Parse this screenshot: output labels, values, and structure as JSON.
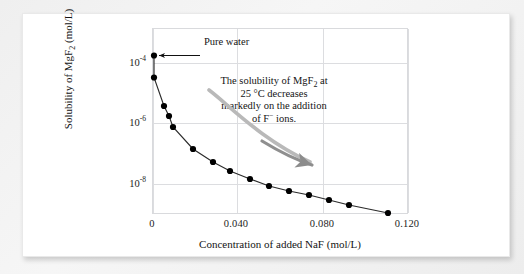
{
  "figure": {
    "background_color": "#ffffff",
    "page_background": "#f1f1f1"
  },
  "axes": {
    "x": {
      "label": "Concentration of added NaF (mol/L)",
      "ticks": [
        "0",
        "0.040",
        "0.080",
        "0.120"
      ],
      "tick_values": [
        0,
        0.04,
        0.08,
        0.12
      ],
      "range": [
        0,
        0.13
      ]
    },
    "y": {
      "label_prefix": "Solubility of MgF",
      "label_sub": "2",
      "label_suffix": " (mol/L)",
      "label": "Solubility of MgF2 (mol/L)",
      "ticks": [
        "10",
        "10",
        "10"
      ],
      "tick_exponents": [
        "-4",
        "-6",
        "-8"
      ],
      "tick_values": [
        0.0001,
        1e-06,
        1e-08
      ],
      "scale": "log",
      "range": [
        3.2e-09,
        0.00032
      ]
    }
  },
  "annotations": {
    "pure_water": {
      "text": "Pure water",
      "arrow": "left-arrow-to-first-point"
    },
    "trend_note": {
      "line1_a": "The solubility of MgF",
      "line1_sub": "2",
      "line1_b": " at",
      "line2": "25 °C decreases",
      "line3": "markedly on  the addition",
      "line4_a": "of F",
      "line4_sup": "−",
      "line4_b": " ions.",
      "full_text": "The solubility of MgF2 at 25 °C decreases markedly on the addition of F− ions.",
      "arrow_color": "#8c8c8c"
    }
  },
  "chart_data": {
    "type": "line",
    "title": "",
    "xlabel": "Concentration of added NaF (mol/L)",
    "ylabel": "Solubility of MgF2 (mol/L)",
    "xlim": [
      0,
      0.13
    ],
    "ylim": [
      3.2e-09,
      0.00032
    ],
    "yscale": "log",
    "grid": true,
    "legend": "none",
    "marker": "filled-circle",
    "line_color": "#2b2b2b",
    "marker_color": "#000000",
    "x": [
      0.0,
      0.0,
      0.005,
      0.0075,
      0.01,
      0.02,
      0.03,
      0.04,
      0.05,
      0.06,
      0.07,
      0.08,
      0.09,
      0.1,
      0.12
    ],
    "y": [
      0.00019,
      6.5e-05,
      9e-06,
      3.5e-06,
      9e-07,
      1.9e-07,
      8.5e-08,
      4.5e-08,
      2.9e-08,
      2e-08,
      1.5e-08,
      1.2e-08,
      9.5e-09,
      7.5e-09,
      5.2e-09
    ],
    "points": [
      {
        "x": 0.0,
        "y": 0.00019,
        "note": "Pure water"
      },
      {
        "x": 0.0,
        "y": 6.5e-05,
        "note": ""
      },
      {
        "x": 0.005,
        "y": 9e-06,
        "note": ""
      },
      {
        "x": 0.0075,
        "y": 3.5e-06,
        "note": ""
      },
      {
        "x": 0.01,
        "y": 9e-07,
        "note": ""
      },
      {
        "x": 0.02,
        "y": 1.9e-07,
        "note": ""
      },
      {
        "x": 0.03,
        "y": 8.5e-08,
        "note": ""
      },
      {
        "x": 0.04,
        "y": 4.5e-08,
        "note": ""
      },
      {
        "x": 0.05,
        "y": 2.9e-08,
        "note": ""
      },
      {
        "x": 0.06,
        "y": 2e-08,
        "note": ""
      },
      {
        "x": 0.07,
        "y": 1.5e-08,
        "note": ""
      },
      {
        "x": 0.08,
        "y": 1.2e-08,
        "note": ""
      },
      {
        "x": 0.09,
        "y": 9.5e-09,
        "note": ""
      },
      {
        "x": 0.1,
        "y": 7.5e-09,
        "note": ""
      },
      {
        "x": 0.12,
        "y": 5.2e-09,
        "note": ""
      }
    ]
  }
}
